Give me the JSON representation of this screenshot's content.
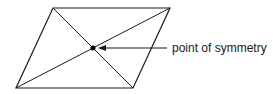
{
  "diagram": {
    "shape": "parallelogram",
    "vertices": {
      "top_left": [
        53,
        8
      ],
      "top_right": [
        170,
        8
      ],
      "bottom_right": [
        133,
        88
      ],
      "bottom_left": [
        16,
        88
      ]
    },
    "center": [
      93,
      48
    ],
    "label": "point of symmetry",
    "stroke_color": "#1a1a1a",
    "background": "#ffffff"
  }
}
